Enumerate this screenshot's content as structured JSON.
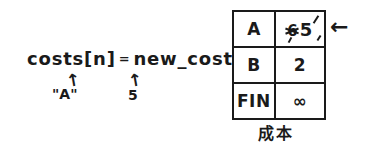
{
  "diagram": {
    "title_caption": "成本",
    "expression": {
      "lhs": "costs[n]",
      "operator": "=",
      "rhs": "new_cost"
    },
    "annotations": [
      {
        "arrow": "↑",
        "label": "\"A\"",
        "targets": "costs[n] index"
      },
      {
        "arrow": "↑",
        "label": "5",
        "targets": "new_cost value"
      }
    ],
    "pointer_arrow": "←",
    "ink_color": "#1a1a1a",
    "background_color": "#ffffff"
  },
  "table": {
    "caption": "成本",
    "rows": [
      {
        "key": "A",
        "value": "5",
        "old_value": "6",
        "struck_out": true
      },
      {
        "key": "B",
        "value": "2",
        "old_value": "",
        "struck_out": false
      },
      {
        "key": "FIN",
        "value": "∞",
        "old_value": "",
        "struck_out": false
      }
    ]
  }
}
